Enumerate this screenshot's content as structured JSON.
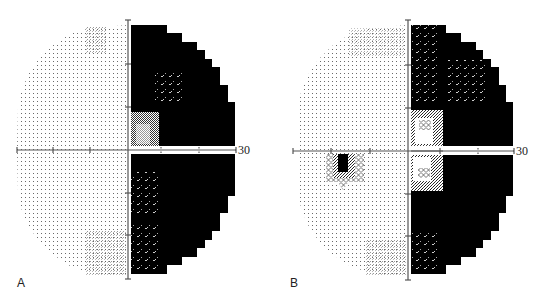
{
  "figure": {
    "panels": [
      {
        "id": "A",
        "label": "A",
        "axis_end_label": "30",
        "findings": "Dense right hemianopic field defect respecting the vertical meridian; left hemifield normal (light dotted)"
      },
      {
        "id": "B",
        "label": "B",
        "axis_end_label": "30",
        "findings": "Right hemianopic defect with partial central sparing near fixation; physiologic blind spot visible in left hemifield below horizontal meridian"
      }
    ]
  },
  "colors": {
    "background": "#ffffff",
    "defect": "#000000",
    "axis": "#555555",
    "dots": "#777777"
  }
}
